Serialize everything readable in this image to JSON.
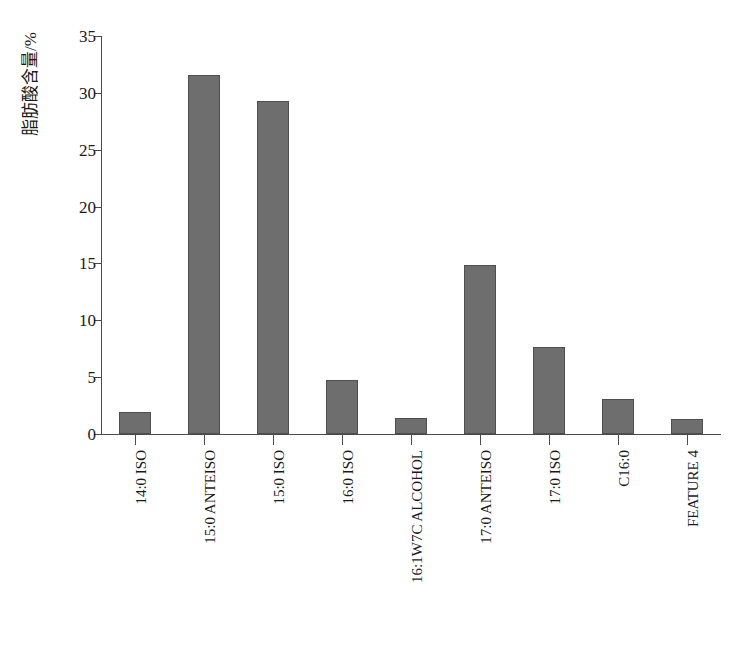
{
  "chart_data": {
    "type": "bar",
    "title": "",
    "xlabel": "",
    "ylabel": "脂肪酸含量/%",
    "ylim": [
      0,
      35
    ],
    "ytick_values": [
      0,
      5,
      10,
      15,
      20,
      25,
      30,
      35
    ],
    "ytick_labels": [
      "0",
      "5",
      "10",
      "15",
      "20",
      "25",
      "30",
      "35"
    ],
    "grid": false,
    "legend": false,
    "bar_color": "#6e6e6e",
    "bar_edge_color": "#4f4f4f",
    "axis_color": "#4a4a4a",
    "categories": [
      "14:0 ISO",
      "15:0 ANTEISO",
      "15:0 ISO",
      "16:0 ISO",
      "16:1W7C ALCOHOL",
      "17:0 ANTEISO",
      "17:0 ISO",
      "C16:0",
      "FEATURE 4"
    ],
    "values": [
      1.95,
      31.6,
      29.3,
      4.75,
      1.4,
      14.9,
      7.65,
      3.1,
      1.3
    ]
  }
}
